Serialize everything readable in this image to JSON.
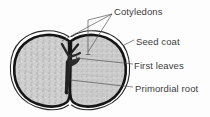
{
  "figure": {
    "background_color": "#fdfdfd",
    "line_color": "#1a1a1a",
    "text_color": "#3c3c3c",
    "fill_color": "#c9c9c9",
    "embryo_color": "#2b2b2b"
  },
  "labels": {
    "cotyledons": "Cotyledons",
    "seed_coat": "Seed coat",
    "first_leaves": "First leaves",
    "primordial_root": "Primordial root"
  }
}
